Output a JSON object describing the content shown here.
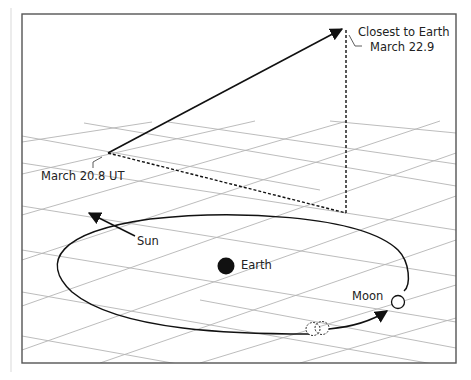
{
  "diagram": {
    "type": "orbital-geometry",
    "labels": {
      "closest": "Closest to Earth",
      "closest_date": "March 22.9",
      "start_date": "March 20.8 UT",
      "sun": "Sun",
      "earth": "Earth",
      "moon": "Moon"
    },
    "colors": {
      "frame": "#555555",
      "grid": "#b4b4b4",
      "ink": "#111111",
      "background": "#ffffff"
    }
  }
}
